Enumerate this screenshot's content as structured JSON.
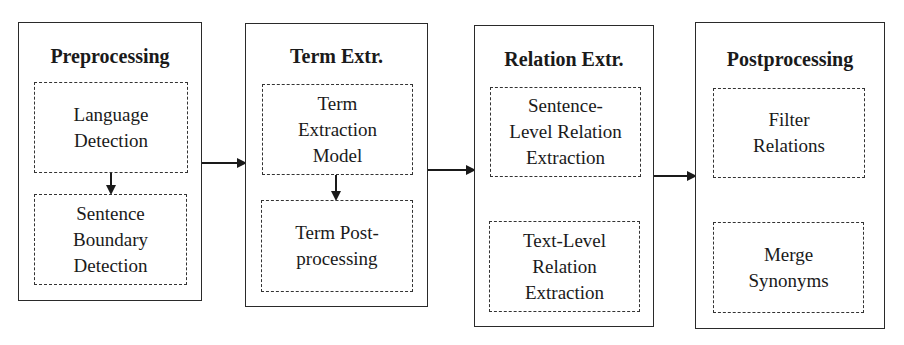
{
  "diagram": {
    "type": "pipeline",
    "stages": [
      {
        "title": "Preprocessing",
        "steps": [
          "Language\nDetection",
          "Sentence\nBoundary\nDetection"
        ],
        "internal_arrow": true
      },
      {
        "title": "Term Extr.",
        "steps": [
          "Term\nExtraction\nModel",
          "Term Post-\nprocessing"
        ],
        "internal_arrow": true
      },
      {
        "title": "Relation Extr.",
        "steps": [
          "Sentence-\nLevel Relation\nExtraction",
          "Text-Level\nRelation\nExtraction"
        ],
        "internal_arrow": false
      },
      {
        "title": "Postprocessing",
        "steps": [
          "Filter\nRelations",
          "Merge\nSynonyms"
        ],
        "internal_arrow": false
      }
    ],
    "edges": [
      {
        "from": "Preprocessing",
        "to": "Term Extr."
      },
      {
        "from": "Term Extr.",
        "to": "Relation Extr."
      },
      {
        "from": "Relation Extr.",
        "to": "Postprocessing"
      }
    ]
  }
}
